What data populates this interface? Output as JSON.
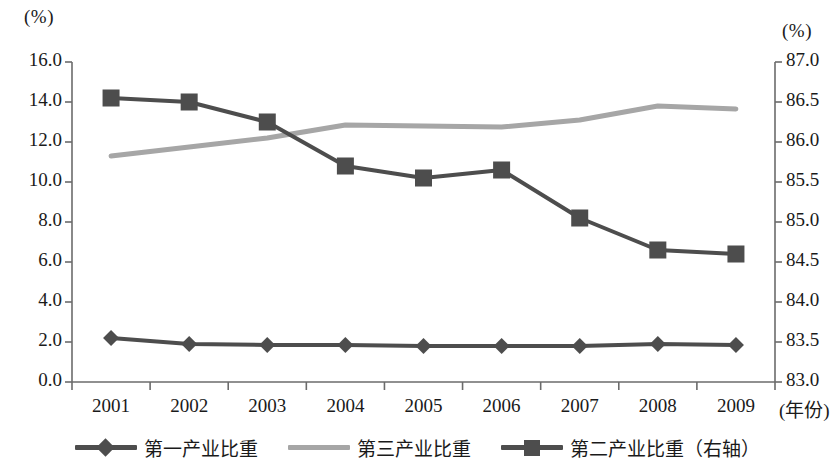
{
  "chart_data": {
    "type": "line",
    "title": "",
    "xlabel": "(年份)",
    "x": [
      "2001",
      "2002",
      "2003",
      "2004",
      "2005",
      "2006",
      "2007",
      "2008",
      "2009"
    ],
    "categories": [
      "2001",
      "2002",
      "2003",
      "2004",
      "2005",
      "2006",
      "2007",
      "2008",
      "2009"
    ],
    "left_axis": {
      "unit_label": "(%)",
      "ylim": [
        0.0,
        16.0
      ],
      "tick_step": 2.0,
      "ticks": [
        "0.0",
        "2.0",
        "4.0",
        "6.0",
        "8.0",
        "10.0",
        "12.0",
        "14.0",
        "16.0"
      ],
      "tick_values": [
        0.0,
        2.0,
        4.0,
        6.0,
        8.0,
        10.0,
        12.0,
        14.0,
        16.0
      ]
    },
    "right_axis": {
      "unit_label": "(%)",
      "ylim": [
        83.0,
        87.0
      ],
      "tick_step": 0.5,
      "ticks": [
        "83.0",
        "83.5",
        "84.0",
        "84.5",
        "85.0",
        "85.5",
        "86.0",
        "86.5",
        "87.0"
      ],
      "tick_values": [
        83.0,
        83.5,
        84.0,
        84.5,
        85.0,
        85.5,
        86.0,
        86.5,
        87.0
      ]
    },
    "grid": false,
    "legend_position": "bottom",
    "series": [
      {
        "name": "第一产业比重",
        "axis": "left",
        "marker": "diamond",
        "color": "#4d4d4d",
        "values": [
          2.2,
          1.9,
          1.85,
          1.85,
          1.8,
          1.8,
          1.8,
          1.9,
          1.85
        ]
      },
      {
        "name": "第三产业比重",
        "axis": "left",
        "marker": "none",
        "color": "#a6a6a6",
        "values": [
          11.3,
          11.75,
          12.2,
          12.85,
          12.8,
          12.75,
          13.1,
          13.8,
          13.65
        ]
      },
      {
        "name": "第二产业比重（右轴）",
        "axis": "right",
        "marker": "square",
        "color": "#4d4d4d",
        "values": [
          86.55,
          86.5,
          86.25,
          85.7,
          85.55,
          85.65,
          85.05,
          84.65,
          84.6
        ]
      }
    ]
  },
  "legend": {
    "items": [
      {
        "label": "第一产业比重",
        "marker": "diamond",
        "color": "#4d4d4d"
      },
      {
        "label": "第三产业比重",
        "marker": "none",
        "color": "#a6a6a6"
      },
      {
        "label": "第二产业比重（右轴）",
        "marker": "square",
        "color": "#4d4d4d"
      }
    ]
  }
}
